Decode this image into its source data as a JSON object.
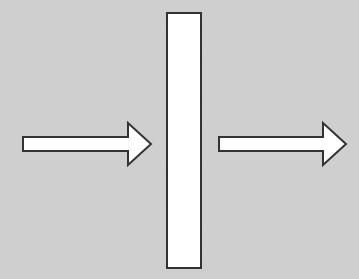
{
  "diagram": {
    "background_color": "#d0d0d0",
    "stroke_color": "#333333",
    "fill_color": "#ffffff",
    "elements": [
      {
        "type": "arrow",
        "name": "incoming-arrow",
        "direction": "right"
      },
      {
        "type": "rectangle",
        "name": "barrier",
        "orientation": "vertical"
      },
      {
        "type": "arrow",
        "name": "outgoing-arrow",
        "direction": "right"
      }
    ]
  }
}
